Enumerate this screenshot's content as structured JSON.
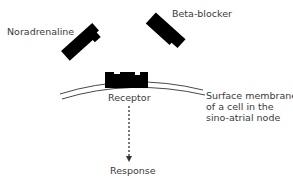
{
  "diagram": {
    "labels": {
      "noradrenaline": "Noradrenaline",
      "beta_blocker": "Beta-blocker",
      "receptor": "Receptor",
      "membrane_line1": "Surface membrane",
      "membrane_line2": "of a cell in the",
      "membrane_line3": "sino-atrial node",
      "response": "Response"
    },
    "colors": {
      "shape_fill": "#000000",
      "line": "#333333",
      "text": "#3a3a3a"
    }
  }
}
